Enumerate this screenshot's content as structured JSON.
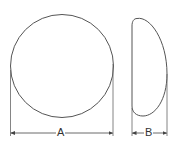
{
  "diagram": {
    "stroke_color": "#555555",
    "views": [
      {
        "name": "front-view",
        "shape": "circle",
        "dimension_label": "A"
      },
      {
        "name": "side-view",
        "shape": "dome-profile",
        "dimension_label": "B"
      }
    ]
  }
}
